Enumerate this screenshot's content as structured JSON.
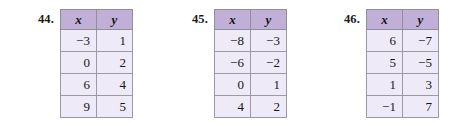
{
  "page": {
    "background_color": "#ffffff",
    "header_fill": "#c0b0d8",
    "cell_fill": "#efeaf7",
    "border_color": "#8f8f96",
    "text_color": "#16161a"
  },
  "exercises": [
    {
      "number": "44.",
      "columns": [
        "x",
        "y"
      ],
      "rows": [
        [
          "−3",
          "1"
        ],
        [
          "0",
          "2"
        ],
        [
          "6",
          "4"
        ],
        [
          "9",
          "5"
        ]
      ]
    },
    {
      "number": "45.",
      "columns": [
        "x",
        "y"
      ],
      "rows": [
        [
          "−8",
          "−3"
        ],
        [
          "−6",
          "−2"
        ],
        [
          "0",
          "1"
        ],
        [
          "4",
          "2"
        ]
      ]
    },
    {
      "number": "46.",
      "columns": [
        "x",
        "y"
      ],
      "rows": [
        [
          "6",
          "−7"
        ],
        [
          "5",
          "−5"
        ],
        [
          "1",
          "3"
        ],
        [
          "−1",
          "7"
        ]
      ]
    }
  ]
}
